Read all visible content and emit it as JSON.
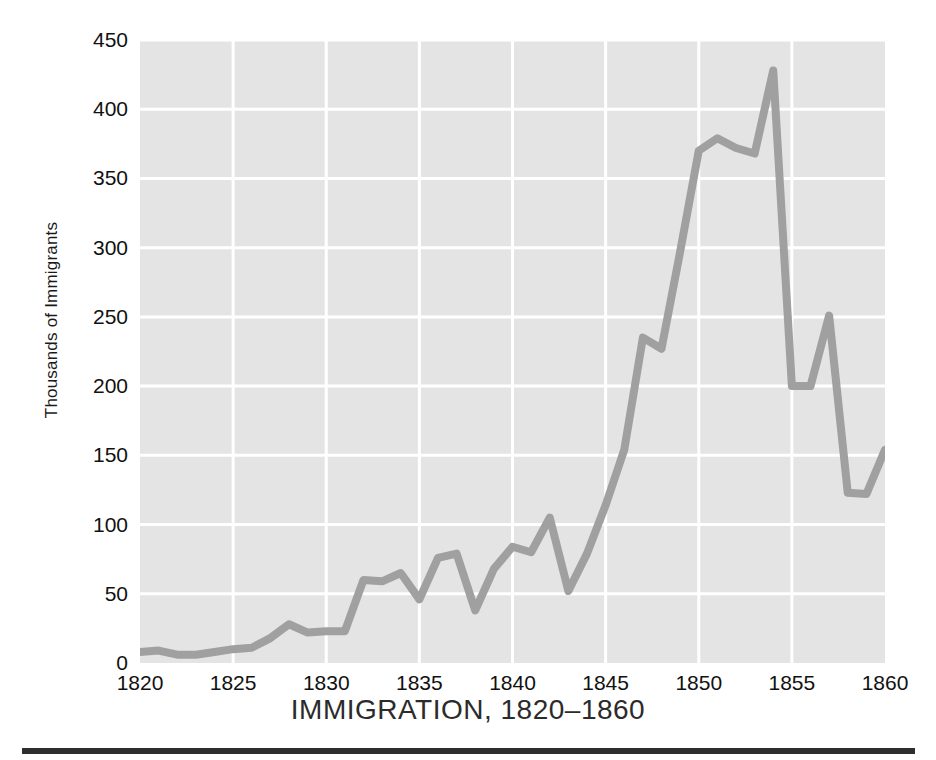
{
  "chart_data": {
    "type": "line",
    "title": "IMMIGRATION, 1820–1860",
    "xlabel": "",
    "ylabel": "Thousands of Immigrants",
    "xlim": [
      1820,
      1860
    ],
    "ylim": [
      0,
      450
    ],
    "grid": true,
    "legend": null,
    "x_ticks": [
      1820,
      1825,
      1830,
      1835,
      1840,
      1845,
      1850,
      1855,
      1860
    ],
    "y_ticks": [
      0,
      50,
      100,
      150,
      200,
      250,
      300,
      350,
      400,
      450
    ],
    "series": [
      {
        "name": "Immigrants (thousands)",
        "color": "#a0a0a0",
        "x": [
          1820,
          1821,
          1822,
          1823,
          1824,
          1825,
          1826,
          1827,
          1828,
          1829,
          1830,
          1831,
          1832,
          1833,
          1834,
          1835,
          1836,
          1837,
          1838,
          1839,
          1840,
          1841,
          1842,
          1843,
          1844,
          1845,
          1846,
          1847,
          1848,
          1849,
          1850,
          1851,
          1852,
          1853,
          1854,
          1855,
          1856,
          1857,
          1858,
          1859,
          1860
        ],
        "values": [
          8,
          9,
          6,
          6,
          8,
          10,
          11,
          18,
          28,
          22,
          23,
          23,
          60,
          59,
          65,
          46,
          76,
          79,
          38,
          68,
          84,
          80,
          105,
          52,
          79,
          114,
          154,
          235,
          227,
          297,
          370,
          379,
          372,
          368,
          428,
          200,
          200,
          251,
          123,
          122,
          154
        ]
      }
    ]
  },
  "axes": {
    "y_tick_labels": [
      "450",
      "400",
      "350",
      "300",
      "250",
      "200",
      "150",
      "100",
      "50",
      "0"
    ],
    "x_tick_labels": [
      "1820",
      "1825",
      "1830",
      "1835",
      "1840",
      "1845",
      "1850",
      "1855",
      "1860"
    ],
    "y_title": "Thousands of Immigrants"
  },
  "figure": {
    "title": "IMMIGRATION, 1820–1860",
    "plot_background_color": "#e4e4e4",
    "grid_color": "#ffffff",
    "line_color": "#a0a0a0",
    "rule_color": "#2e2e2e"
  }
}
